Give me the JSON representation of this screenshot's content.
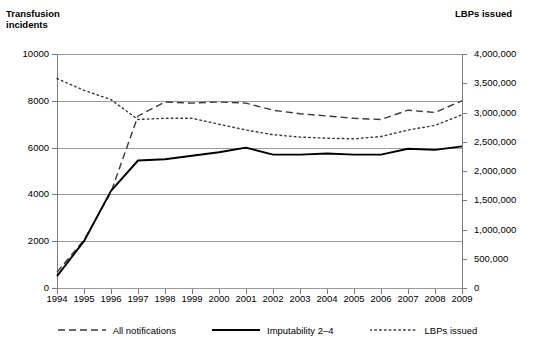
{
  "titles": {
    "left_axis": "Transfusion\nincidents",
    "right_axis": "LBPs issued"
  },
  "legend": {
    "items": [
      {
        "label": "All notifications",
        "style": "dashed"
      },
      {
        "label": "Imputability 2–4",
        "style": "solid"
      },
      {
        "label": "LBPs issued",
        "style": "dotted"
      }
    ]
  },
  "chart_data": {
    "type": "line",
    "title": "",
    "xlabel": "",
    "ylabel": "Transfusion incidents",
    "y2label": "LBPs issued",
    "grid": true,
    "legend_position": "bottom",
    "categories": [
      1994,
      1995,
      1996,
      1997,
      1998,
      1999,
      2000,
      2001,
      2002,
      2003,
      2004,
      2005,
      2006,
      2007,
      2008,
      2009
    ],
    "x_tick_labels": [
      "1994",
      "1995",
      "1996",
      "1997",
      "1998",
      "1999",
      "2000",
      "2001",
      "2002",
      "2003",
      "2004",
      "2005",
      "2006",
      "2007",
      "2008",
      "2009"
    ],
    "ylim": [
      0,
      10000
    ],
    "y_ticks": [
      0,
      2000,
      4000,
      6000,
      8000,
      10000
    ],
    "y_tick_labels": [
      "0",
      "2000",
      "4000",
      "6000",
      "8000",
      "10000"
    ],
    "y2lim": [
      0,
      4000000
    ],
    "y2_ticks": [
      0,
      500000,
      1000000,
      1500000,
      2000000,
      2500000,
      3000000,
      3500000,
      4000000
    ],
    "y2_tick_labels": [
      "0",
      "500,000",
      "1,000,000",
      "1,500,000",
      "2,000,000",
      "2,500,000",
      "3,000,000",
      "3,500,000",
      "4,000,000"
    ],
    "series": [
      {
        "name": "All notifications",
        "axis": "left",
        "style": "dashed",
        "values": [
          680,
          2050,
          4100,
          7350,
          7950,
          7900,
          7950,
          7900,
          7600,
          7450,
          7350,
          7250,
          7200,
          7600,
          7500,
          8000
        ]
      },
      {
        "name": "Imputability 2–4",
        "axis": "left",
        "style": "solid",
        "values": [
          510,
          2000,
          4150,
          5450,
          5500,
          5650,
          5800,
          6000,
          5700,
          5700,
          5750,
          5700,
          5700,
          5950,
          5900,
          6050
        ]
      },
      {
        "name": "LBPs issued",
        "axis": "right",
        "style": "dotted",
        "values": [
          3580000,
          3380000,
          3220000,
          2880000,
          2900000,
          2900000,
          2800000,
          2700000,
          2620000,
          2580000,
          2560000,
          2550000,
          2590000,
          2700000,
          2780000,
          2960000
        ]
      }
    ]
  }
}
